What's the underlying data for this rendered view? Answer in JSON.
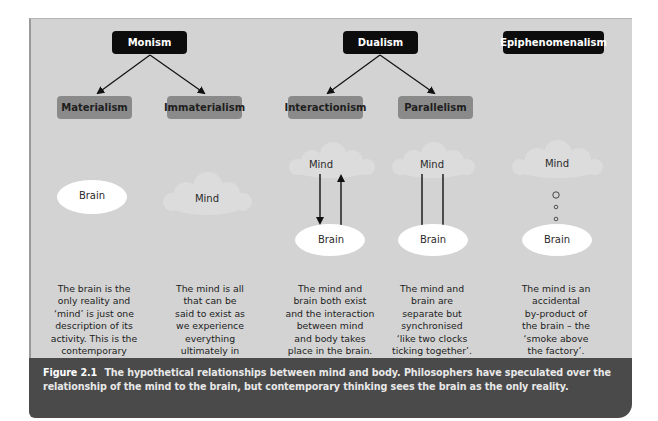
{
  "figure": {
    "top_nodes": [
      {
        "id": "monism",
        "label": "Monism"
      },
      {
        "id": "dualism",
        "label": "Dualism"
      },
      {
        "id": "epiphenomenalism",
        "label": "Epiphenomenalism"
      }
    ],
    "sub_nodes": [
      {
        "id": "materialism",
        "label": "Materialism",
        "parent": "Monism"
      },
      {
        "id": "immaterialism",
        "label": "Immaterialism",
        "parent": "Monism"
      },
      {
        "id": "interactionism",
        "label": "Interactionism",
        "parent": "Dualism"
      },
      {
        "id": "parallelism",
        "label": "Parallelism",
        "parent": "Dualism"
      }
    ],
    "columns": [
      {
        "id": "materialism",
        "illustration": {
          "brain": "Brain"
        },
        "description": "The brain is the\nonly reality and\n‘mind’ is just one\ndescription of its\nactivity. This is the\ncontemporary\nposition."
      },
      {
        "id": "immaterialism",
        "illustration": {
          "mind": "Mind"
        },
        "description": "The mind is all\nthat can be\nsaid to exist as\nwe experience\neverything\nultimately in\nthe mind."
      },
      {
        "id": "interactionism",
        "illustration": {
          "mind": "Mind",
          "brain": "Brain",
          "connector": "two-way arrows"
        },
        "description": "The mind and\nbrain both exist\nand the interaction\nbetween mind\nand body takes\nplace in the brain."
      },
      {
        "id": "parallelism",
        "illustration": {
          "mind": "Mind",
          "brain": "Brain",
          "connector": "parallel lines"
        },
        "description": "The mind and\nbrain are\nseparate but\nsynchronised\n‘like two clocks\nticking together’."
      },
      {
        "id": "epiphenomenalism",
        "illustration": {
          "mind": "Mind",
          "brain": "Brain",
          "connector": "rising bubbles"
        },
        "description": "The mind is an\naccidental\nby-product of\nthe brain – the\n‘smoke above\nthe factory’."
      }
    ],
    "caption": {
      "number": "Figure 2.1",
      "text": "The hypothetical relationships between mind and body. Philosophers have speculated over the relationship of the mind to the brain, but contemporary thinking sees the brain as the only reality."
    },
    "colors": {
      "panel_bg": "#d3d3d3",
      "top_node_bg": "#0c0c0c",
      "sub_node_bg": "#8a8a8a",
      "caption_bg": "#4a4a4a",
      "brain_fill": "#ffffff",
      "cloud_fill": "#dedede"
    }
  }
}
